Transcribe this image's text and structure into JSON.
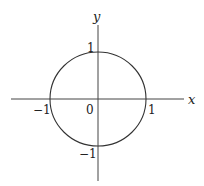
{
  "diagram": {
    "axes": {
      "x_label": "x",
      "y_label": "y",
      "origin_label": "0"
    },
    "ticks": {
      "x_neg": "−1",
      "x_pos": "1",
      "y_pos": "1",
      "y_neg": "−1"
    },
    "curve": {
      "type": "circle",
      "equation": "x^2 + y^2 = 1",
      "center": [
        0,
        0
      ],
      "radius": 1
    },
    "colors": {
      "stroke": "#333333",
      "background": "#ffffff"
    }
  }
}
